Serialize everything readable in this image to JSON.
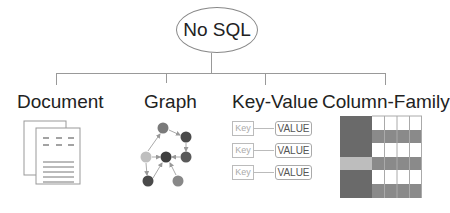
{
  "root": {
    "label": "No SQL"
  },
  "categories": [
    {
      "label": "Document",
      "icon": "document-icon"
    },
    {
      "label": "Graph",
      "icon": "graph-icon"
    },
    {
      "label": "Key-Value",
      "icon": "key-value-icon"
    },
    {
      "label": "Column-Family",
      "icon": "column-family-icon"
    }
  ],
  "key_value": {
    "pairs": [
      {
        "key": "Key",
        "value": "VALUE"
      },
      {
        "key": "Key",
        "value": "VALUE"
      },
      {
        "key": "Key",
        "value": "VALUE"
      }
    ]
  },
  "colors": {
    "line": "#999999",
    "dark_cell": "#6a6a6a",
    "mid_cell": "#8a8a8a",
    "light_cell": "#bdbdbd",
    "node_dark": "#4a4a4a",
    "node_mid": "#7a7a7a",
    "node_light": "#bfbfbf"
  }
}
